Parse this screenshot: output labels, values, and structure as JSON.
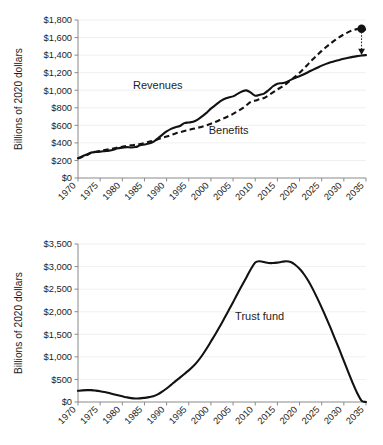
{
  "figure": {
    "panels": [
      "revenues-benefits",
      "trust-fund"
    ]
  },
  "chart_data": [
    {
      "id": "revenues-benefits",
      "type": "line",
      "title": "",
      "xlabel": "",
      "ylabel": "Billions of 2020 dollars",
      "xlim": [
        1970,
        2035
      ],
      "ylim": [
        0,
        1800
      ],
      "xticks": [
        "1970",
        "1975",
        "1980",
        "1985",
        "1990",
        "1995",
        "2000",
        "2005",
        "2010",
        "2015",
        "2020",
        "2025",
        "2030",
        "2035"
      ],
      "xtick_values": [
        1970,
        1975,
        1980,
        1985,
        1990,
        1995,
        2000,
        2005,
        2010,
        2015,
        2020,
        2025,
        2030,
        2035
      ],
      "yticks": [
        "$0",
        "$200",
        "$400",
        "$600",
        "$800",
        "$1,000",
        "$1,200",
        "$1,400",
        "$1,600",
        "$1,800"
      ],
      "ytick_values": [
        0,
        200,
        400,
        600,
        800,
        1000,
        1200,
        1400,
        1600,
        1800
      ],
      "grid": true,
      "legend": "inline-annotations",
      "series": [
        {
          "name": "Revenues",
          "style": "solid",
          "label_x": 1988,
          "label_y": 1010,
          "x": [
            1970,
            1971,
            1972,
            1973,
            1974,
            1975,
            1976,
            1977,
            1978,
            1979,
            1980,
            1981,
            1982,
            1983,
            1984,
            1985,
            1986,
            1987,
            1988,
            1989,
            1990,
            1991,
            1992,
            1993,
            1994,
            1995,
            1996,
            1997,
            1998,
            1999,
            2000,
            2001,
            2002,
            2003,
            2004,
            2005,
            2006,
            2007,
            2008,
            2009,
            2010,
            2011,
            2012,
            2013,
            2014,
            2015,
            2016,
            2017,
            2018,
            2019,
            2020,
            2021,
            2022,
            2023,
            2024,
            2025,
            2026,
            2027,
            2028,
            2029,
            2030,
            2031,
            2032,
            2033,
            2034,
            2035
          ],
          "y": [
            225,
            248,
            268,
            290,
            296,
            300,
            306,
            312,
            322,
            338,
            345,
            352,
            348,
            352,
            372,
            382,
            392,
            412,
            450,
            492,
            530,
            560,
            578,
            592,
            625,
            632,
            640,
            665,
            702,
            742,
            790,
            830,
            870,
            900,
            918,
            930,
            958,
            985,
            998,
            972,
            938,
            948,
            962,
            1000,
            1045,
            1075,
            1080,
            1092,
            1118,
            1140,
            1160,
            1182,
            1208,
            1232,
            1256,
            1280,
            1300,
            1318,
            1332,
            1345,
            1358,
            1370,
            1380,
            1388,
            1395,
            1400
          ],
          "end_marker": {
            "shape": "arrow",
            "x": 2034,
            "y": 1420
          }
        },
        {
          "name": "Benefits",
          "style": "dashed",
          "label_x": 2004,
          "label_y": 500,
          "x": [
            1970,
            1971,
            1972,
            1973,
            1974,
            1975,
            1976,
            1977,
            1978,
            1979,
            1980,
            1981,
            1982,
            1983,
            1984,
            1985,
            1986,
            1987,
            1988,
            1989,
            1990,
            1991,
            1992,
            1993,
            1994,
            1995,
            1996,
            1997,
            1998,
            1999,
            2000,
            2001,
            2002,
            2003,
            2004,
            2005,
            2006,
            2007,
            2008,
            2009,
            2010,
            2011,
            2012,
            2013,
            2014,
            2015,
            2016,
            2017,
            2018,
            2019,
            2020,
            2021,
            2022,
            2023,
            2024,
            2025,
            2026,
            2027,
            2028,
            2029,
            2030,
            2031,
            2032,
            2033,
            2034,
            2035
          ],
          "y": [
            222,
            242,
            262,
            288,
            300,
            308,
            318,
            328,
            336,
            348,
            356,
            366,
            372,
            378,
            388,
            398,
            412,
            425,
            442,
            458,
            472,
            490,
            508,
            522,
            535,
            548,
            560,
            572,
            585,
            600,
            618,
            638,
            660,
            682,
            705,
            730,
            760,
            790,
            828,
            868,
            882,
            898,
            912,
            942,
            975,
            1008,
            1038,
            1072,
            1115,
            1155,
            1198,
            1248,
            1300,
            1352,
            1400,
            1448,
            1492,
            1532,
            1570,
            1605,
            1635,
            1662,
            1682,
            1696,
            1700,
            1690
          ],
          "end_marker": {
            "shape": "dot",
            "x": 2034,
            "y": 1700
          }
        }
      ],
      "annotations": [
        {
          "type": "drop-connector",
          "from_y": 1700,
          "to_y": 1420,
          "x": 2034,
          "style": "dotted"
        }
      ]
    },
    {
      "id": "trust-fund",
      "type": "line",
      "title": "",
      "xlabel": "",
      "ylabel": "Billions of 2020 dollars",
      "xlim": [
        1970,
        2035
      ],
      "ylim": [
        0,
        3500
      ],
      "xticks": [
        "1970",
        "1975",
        "1980",
        "1985",
        "1990",
        "1995",
        "2000",
        "2005",
        "2010",
        "2015",
        "2020",
        "2025",
        "2030",
        "2035"
      ],
      "xtick_values": [
        1970,
        1975,
        1980,
        1985,
        1990,
        1995,
        2000,
        2005,
        2010,
        2015,
        2020,
        2025,
        2030,
        2035
      ],
      "yticks": [
        "$0",
        "$500",
        "$1,000",
        "$1,500",
        "$2,000",
        "$2,500",
        "$3,000",
        "$3,500"
      ],
      "ytick_values": [
        0,
        500,
        1000,
        1500,
        2000,
        2500,
        3000,
        3500
      ],
      "grid": true,
      "legend": "inline-annotations",
      "series": [
        {
          "name": "Trust fund",
          "style": "solid",
          "label_x": 2011,
          "label_y": 1820,
          "x": [
            1970,
            1971,
            1972,
            1973,
            1974,
            1975,
            1976,
            1977,
            1978,
            1979,
            1980,
            1981,
            1982,
            1983,
            1984,
            1985,
            1986,
            1987,
            1988,
            1989,
            1990,
            1991,
            1992,
            1993,
            1994,
            1995,
            1996,
            1997,
            1998,
            1999,
            2000,
            2001,
            2002,
            2003,
            2004,
            2005,
            2006,
            2007,
            2008,
            2009,
            2010,
            2011,
            2012,
            2013,
            2014,
            2015,
            2016,
            2017,
            2018,
            2019,
            2020,
            2021,
            2022,
            2023,
            2024,
            2025,
            2026,
            2027,
            2028,
            2029,
            2030,
            2031,
            2032,
            2033,
            2034,
            2035
          ],
          "y": [
            248,
            258,
            262,
            262,
            252,
            238,
            220,
            198,
            172,
            148,
            126,
            104,
            86,
            78,
            80,
            92,
            108,
            128,
            168,
            228,
            300,
            380,
            462,
            540,
            620,
            700,
            790,
            900,
            1030,
            1180,
            1340,
            1500,
            1670,
            1850,
            2030,
            2210,
            2400,
            2580,
            2760,
            2940,
            3090,
            3118,
            3100,
            3080,
            3078,
            3088,
            3105,
            3118,
            3100,
            3040,
            2950,
            2830,
            2680,
            2500,
            2300,
            2090,
            1870,
            1640,
            1400,
            1160,
            910,
            660,
            420,
            200,
            30,
            0
          ]
        }
      ],
      "annotations": []
    }
  ]
}
